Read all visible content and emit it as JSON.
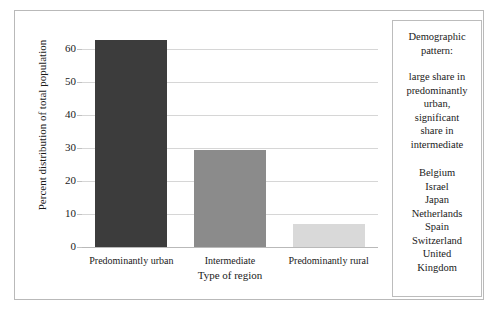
{
  "chart_data": {
    "type": "bar",
    "title": "",
    "categories": [
      "Predominantly urban",
      "Intermediate",
      "Predominantly rural"
    ],
    "values": [
      63,
      29.5,
      7
    ],
    "xlabel": "Type of region",
    "ylabel": "Percent distribution of total population",
    "ylim": [
      0,
      65
    ],
    "yticks": [
      0,
      10,
      20,
      30,
      40,
      50,
      60
    ],
    "ytick_labels": [
      "0",
      "10",
      "20",
      "30",
      "40",
      "50",
      "60"
    ],
    "grid": true,
    "legend": false,
    "bar_colors": [
      "#3c3c3c",
      "#8b8b8b",
      "#d9d9d9"
    ]
  },
  "panel": {
    "heading": "Demographic\npattern:",
    "description": "large share in\npredominantly\nurban,\nsignificant\nshare in\nintermediate",
    "countries": [
      "Belgium",
      "Israel",
      "Japan",
      "Netherlands",
      "Spain",
      "Switzerland",
      "United\nKingdom"
    ]
  },
  "colors": {
    "frame": "#b9b9b9",
    "gridline": "#d6d6d6",
    "text": "#1a1a1a"
  }
}
